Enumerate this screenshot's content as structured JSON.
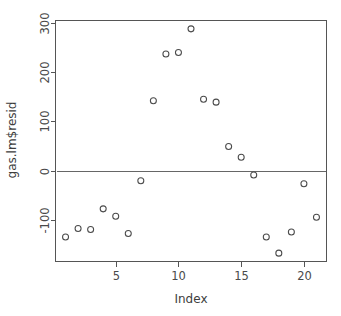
{
  "chart_data": {
    "type": "scatter",
    "title": "",
    "subtitle": "",
    "xlabel": "Index",
    "ylabel": "gas.lm$resid",
    "x": [
      1,
      2,
      3,
      4,
      5,
      6,
      7,
      8,
      9,
      10,
      11,
      12,
      13,
      14,
      15,
      16,
      17,
      18,
      19,
      20,
      21
    ],
    "y": [
      -135,
      -118,
      -120,
      -78,
      -93,
      -128,
      -21,
      142,
      237,
      240,
      288,
      145,
      139,
      49,
      27,
      -9,
      -135,
      -168,
      -125,
      -27,
      -95
    ],
    "series": [
      {
        "name": "gas.lm$resid",
        "values": [
          -135,
          -118,
          -120,
          -78,
          -93,
          -128,
          -21,
          142,
          237,
          240,
          288,
          145,
          139,
          49,
          27,
          -9,
          -135,
          -168,
          -125,
          -27,
          -95
        ]
      }
    ],
    "xlim": [
      0.2,
      21.8
    ],
    "ylim": [
      -185,
      305
    ],
    "xticks": [
      5,
      10,
      15,
      20
    ],
    "xtick_labels": [
      "5",
      "10",
      "15",
      "20"
    ],
    "yticks": [
      -100,
      0,
      100,
      200,
      300
    ],
    "ytick_labels": [
      "-100",
      "0",
      "100",
      "200",
      "300"
    ],
    "grid": false,
    "legend": "none",
    "annotations": [
      {
        "kind": "horizontal-reference-line",
        "value": 0,
        "label": "zero-line"
      }
    ],
    "marker": "open-circle",
    "marker_color": "#4a4a4a",
    "reference_line_color": "#666666",
    "axis_color": "#555555",
    "background_color": "#ffffff"
  },
  "axes": {
    "x_title": "Index",
    "y_title": "gas.lm$resid"
  }
}
